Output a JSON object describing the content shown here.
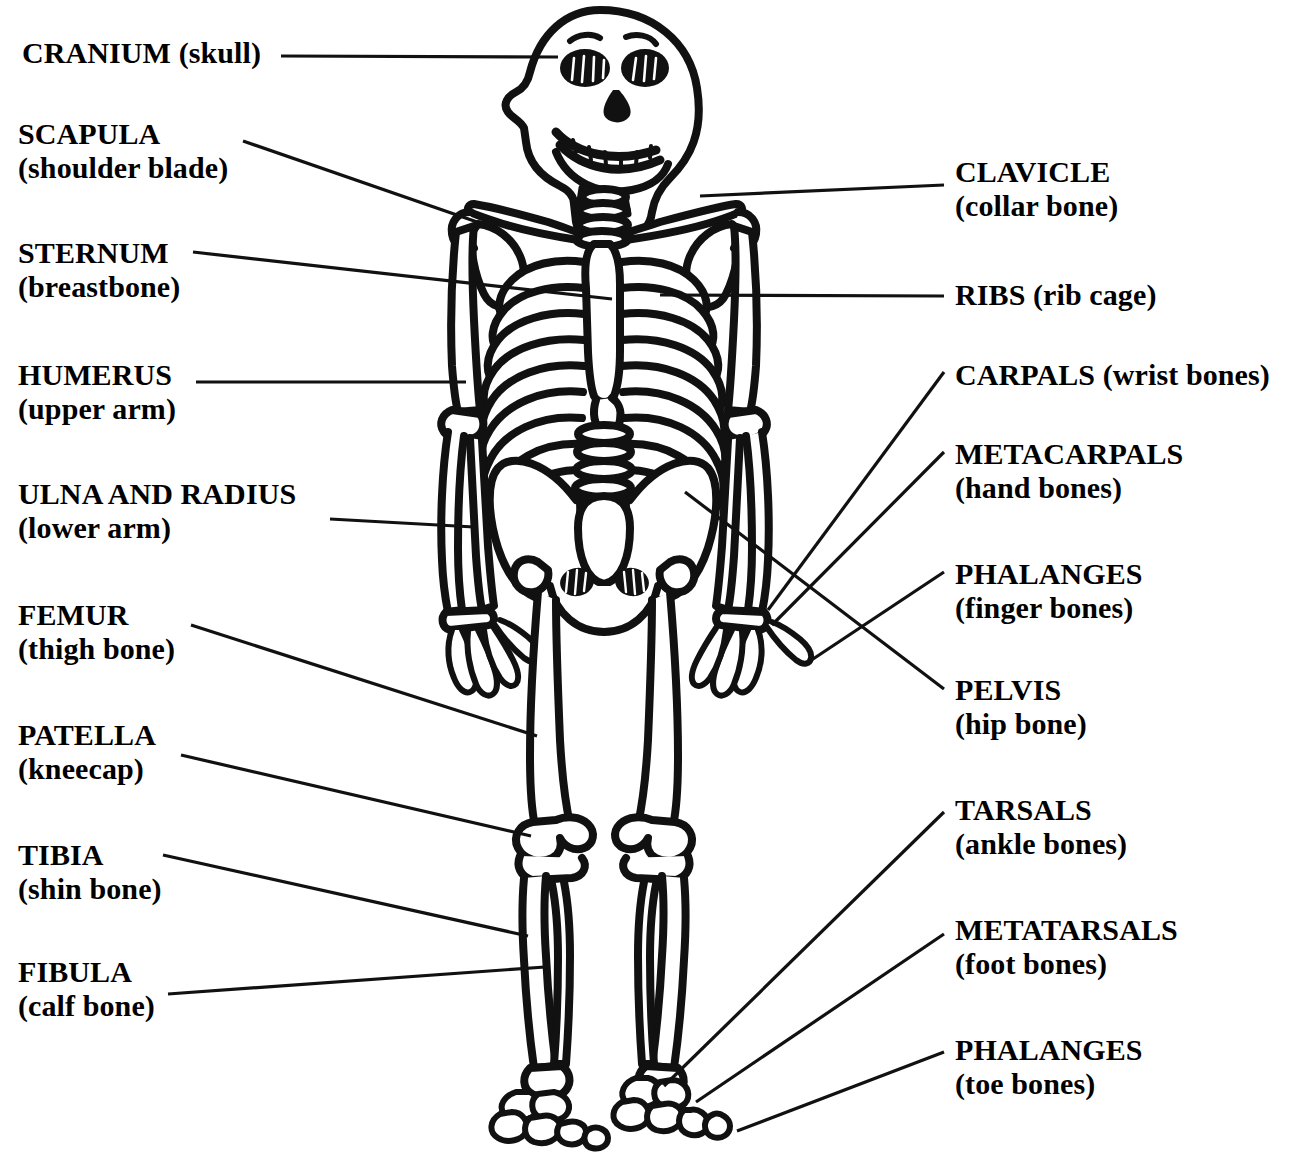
{
  "figure": {
    "style": "black-and-white line drawing",
    "stroke_color": "#111111",
    "fill_color": "#ffffff",
    "background_color": "#ffffff"
  },
  "labels": {
    "left": [
      {
        "id": "cranium",
        "term": "CRANIUM",
        "common": "(skull)",
        "inline": true,
        "x": 22,
        "y": 36,
        "leader": {
          "x1": 281,
          "y1": 56,
          "x2": 558,
          "y2": 57
        }
      },
      {
        "id": "scapula",
        "term": "SCAPULA",
        "common": "(shoulder blade)",
        "inline": false,
        "x": 18,
        "y": 117,
        "leader": {
          "x1": 243,
          "y1": 141,
          "x2": 480,
          "y2": 223
        }
      },
      {
        "id": "sternum",
        "term": "STERNUM",
        "common": "(breastbone)",
        "inline": false,
        "x": 18,
        "y": 236,
        "leader": {
          "x1": 193,
          "y1": 252,
          "x2": 612,
          "y2": 299
        }
      },
      {
        "id": "humerus",
        "term": "HUMERUS",
        "common": "(upper arm)",
        "inline": false,
        "x": 18,
        "y": 358,
        "leader": {
          "x1": 196,
          "y1": 382,
          "x2": 466,
          "y2": 382
        }
      },
      {
        "id": "ulna-radius",
        "term": "ULNA AND RADIUS",
        "common": "(lower arm)",
        "inline": false,
        "x": 18,
        "y": 477,
        "leader": {
          "x1": 330,
          "y1": 519,
          "x2": 474,
          "y2": 527
        }
      },
      {
        "id": "femur",
        "term": "FEMUR",
        "common": "(thigh bone)",
        "inline": false,
        "x": 18,
        "y": 598,
        "leader": {
          "x1": 191,
          "y1": 625,
          "x2": 537,
          "y2": 736
        }
      },
      {
        "id": "patella",
        "term": "PATELLA",
        "common": "(kneecap)",
        "inline": false,
        "x": 18,
        "y": 718,
        "leader": {
          "x1": 181,
          "y1": 755,
          "x2": 531,
          "y2": 836
        }
      },
      {
        "id": "tibia",
        "term": "TIBIA",
        "common": "(shin bone)",
        "inline": false,
        "x": 18,
        "y": 838,
        "leader": {
          "x1": 163,
          "y1": 855,
          "x2": 528,
          "y2": 936
        }
      },
      {
        "id": "fibula",
        "term": "FIBULA",
        "common": "(calf bone)",
        "inline": false,
        "x": 18,
        "y": 955,
        "leader": {
          "x1": 168,
          "y1": 994,
          "x2": 545,
          "y2": 967
        }
      }
    ],
    "right": [
      {
        "id": "clavicle",
        "term": "CLAVICLE",
        "common": "(collar bone)",
        "inline": false,
        "x": 955,
        "y": 155,
        "leader": {
          "x1": 700,
          "y1": 196,
          "x2": 944,
          "y2": 185
        }
      },
      {
        "id": "ribs",
        "term": "RIBS (rib cage)",
        "common": "",
        "inline": true,
        "x": 955,
        "y": 278,
        "leader": {
          "x1": 660,
          "y1": 295,
          "x2": 944,
          "y2": 296
        }
      },
      {
        "id": "carpals",
        "term": "CARPALS (wrist bones)",
        "common": "",
        "inline": true,
        "x": 955,
        "y": 358,
        "leader": {
          "x1": 768,
          "y1": 610,
          "x2": 944,
          "y2": 372
        }
      },
      {
        "id": "metacarpals",
        "term": "METACARPALS",
        "common": "(hand bones)",
        "inline": false,
        "x": 955,
        "y": 437,
        "leader": {
          "x1": 772,
          "y1": 625,
          "x2": 944,
          "y2": 452
        }
      },
      {
        "id": "phalanges-fingers",
        "term": "PHALANGES",
        "common": "(finger bones)",
        "inline": false,
        "x": 955,
        "y": 557,
        "leader": {
          "x1": 807,
          "y1": 663,
          "x2": 944,
          "y2": 572
        }
      },
      {
        "id": "pelvis",
        "term": "PELVIS",
        "common": "(hip bone)",
        "inline": false,
        "x": 955,
        "y": 673,
        "leader": {
          "x1": 685,
          "y1": 492,
          "x2": 944,
          "y2": 689
        }
      },
      {
        "id": "tarsals",
        "term": "TARSALS",
        "common": "(ankle bones)",
        "inline": false,
        "x": 955,
        "y": 793,
        "leader": {
          "x1": 664,
          "y1": 1086,
          "x2": 944,
          "y2": 812
        }
      },
      {
        "id": "metatarsals",
        "term": "METATARSALS",
        "common": "(foot bones)",
        "inline": false,
        "x": 955,
        "y": 913,
        "leader": {
          "x1": 696,
          "y1": 1102,
          "x2": 944,
          "y2": 934
        }
      },
      {
        "id": "phalanges-toes",
        "term": "PHALANGES",
        "common": "(toe bones)",
        "inline": false,
        "x": 955,
        "y": 1033,
        "leader": {
          "x1": 737,
          "y1": 1131,
          "x2": 944,
          "y2": 1052
        }
      }
    ]
  }
}
